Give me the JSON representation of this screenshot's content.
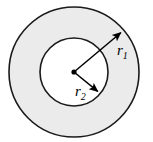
{
  "figure": {
    "background_color": "#ffffff",
    "width": 153,
    "height": 142
  },
  "labels": {
    "outer_radius": {
      "symbol": "r",
      "subscript": "1",
      "text": "r1"
    },
    "inner_radius": {
      "symbol": "r",
      "subscript": "2",
      "text": "r2"
    }
  },
  "colors": {
    "annulus_fill": "#ebebeb",
    "inner_fill": "#ffffff",
    "stroke": "#1a1a1a",
    "arrow": "#000000",
    "center_dot": "#000000"
  },
  "chart_data": {
    "type": "diagram",
    "shape": "annulus",
    "center": {
      "x": 74,
      "y": 72
    },
    "circles": [
      {
        "name": "outer-circle",
        "radius": 65,
        "fill": "#ebebeb",
        "stroke": "#1a1a1a",
        "stroke_width": 1.6,
        "label": "r1"
      },
      {
        "name": "inner-circle",
        "radius": 34,
        "fill": "#ffffff",
        "stroke": "#1a1a1a",
        "stroke_width": 1.6,
        "label": "r2"
      }
    ],
    "arrows": [
      {
        "name": "outer-radius-arrow",
        "label": "r1",
        "from": {
          "x": 74,
          "y": 72
        },
        "to": {
          "x": 124,
          "y": 30
        },
        "direction": "up-right",
        "terminates_at": "outer-circle"
      },
      {
        "name": "inner-radius-arrow",
        "label": "r2",
        "from": {
          "x": 74,
          "y": 72
        },
        "to": {
          "x": 101,
          "y": 94
        },
        "direction": "down-right",
        "terminates_at": "inner-circle"
      }
    ],
    "center_marker": {
      "name": "center-dot",
      "x": 74,
      "y": 72,
      "radius": 2.6
    }
  }
}
